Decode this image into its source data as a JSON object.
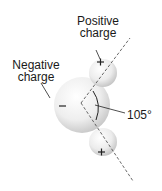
{
  "diagram": {
    "labels": {
      "positive_line1": "Positive",
      "positive_line2": "charge",
      "negative_line1": "Negative",
      "negative_line2": "charge",
      "angle": "105°"
    },
    "symbols": {
      "oxygen": "−",
      "hydrogen_top": "+",
      "hydrogen_bottom": "+"
    },
    "colors": {
      "sphere_light": "#fafafa",
      "sphere_dark": "#c8c8c8",
      "line": "#333333"
    }
  }
}
